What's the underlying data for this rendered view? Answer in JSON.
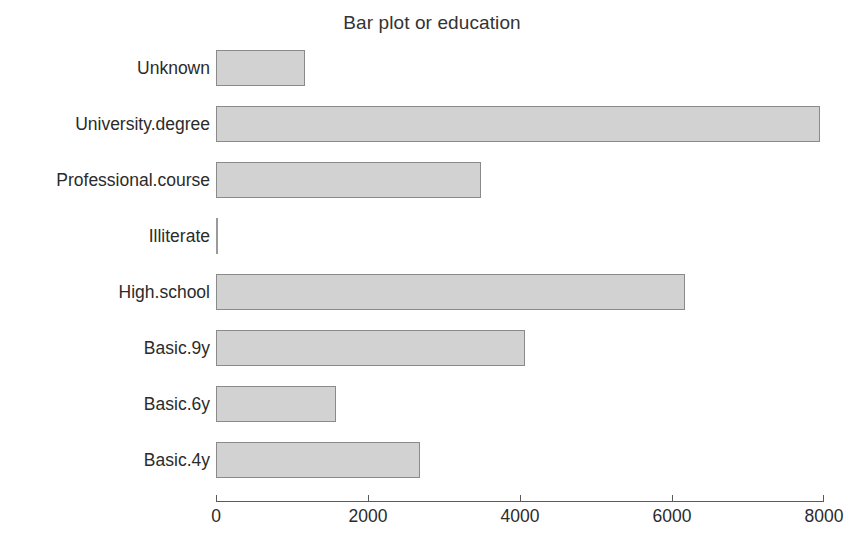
{
  "chart_data": {
    "type": "bar",
    "orientation": "horizontal",
    "title": "Bar plot or education",
    "xlabel": "",
    "ylabel": "",
    "categories": [
      "Unknown",
      "University.degree",
      "Professional.course",
      "Illiterate",
      "High.school",
      "Basic.9y",
      "Basic.6y",
      "Basic.4y"
    ],
    "values": [
      1170,
      7950,
      3490,
      18,
      6170,
      4070,
      1580,
      2690
    ],
    "xlim": [
      0,
      8000
    ],
    "xticks": [
      0,
      2000,
      4000,
      6000,
      8000
    ],
    "xtick_labels": [
      "0",
      "2000",
      "4000",
      "6000",
      "8000"
    ],
    "grid": false,
    "legend": null,
    "bar_fill_color": "#d2d2d2",
    "bar_edge_color": "#8a8a8a",
    "axis_color": "#5a5a5a",
    "background_color": "#ffffff"
  },
  "caption": {
    "text": ""
  }
}
